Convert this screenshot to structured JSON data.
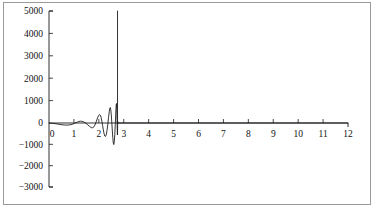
{
  "chart_data": {
    "type": "line",
    "title": "",
    "subtitle": "",
    "xlabel": "",
    "ylabel": "",
    "xlim": [
      0,
      12
    ],
    "ylim": [
      -3000,
      5000
    ],
    "grid": false,
    "legend": null,
    "x_ticks": [
      0,
      1,
      2,
      3,
      4,
      5,
      6,
      7,
      8,
      9,
      10,
      11,
      12
    ],
    "x_tick_labels": [
      "0",
      "1",
      "2",
      "3",
      "4",
      "5",
      "6",
      "7",
      "8",
      "9",
      "10",
      "11",
      "12"
    ],
    "y_ticks": [
      -3000,
      -2000,
      -1000,
      0,
      1000,
      2000,
      3000,
      4000,
      5000
    ],
    "y_tick_labels": [
      "-3000",
      "-2000",
      "-1000",
      "0",
      "1000",
      "2000",
      "3000",
      "4000",
      "5000"
    ],
    "annotations": [
      {
        "name": "vertical-asymptote",
        "x": 2.75,
        "y_from": 0,
        "y_to": 5000
      }
    ],
    "series": [
      {
        "name": "oscillating-divergent-curve",
        "color": "#111111",
        "points": [
          [
            0.0,
            0
          ],
          [
            0.08,
            -8
          ],
          [
            0.16,
            -18
          ],
          [
            0.24,
            -30
          ],
          [
            0.32,
            -45
          ],
          [
            0.4,
            -60
          ],
          [
            0.48,
            -74
          ],
          [
            0.56,
            -88
          ],
          [
            0.64,
            -96
          ],
          [
            0.72,
            -98
          ],
          [
            0.8,
            -92
          ],
          [
            0.88,
            -76
          ],
          [
            0.96,
            -50
          ],
          [
            1.02,
            -20
          ],
          [
            1.08,
            12
          ],
          [
            1.14,
            44
          ],
          [
            1.2,
            68
          ],
          [
            1.26,
            80
          ],
          [
            1.32,
            76
          ],
          [
            1.38,
            56
          ],
          [
            1.44,
            20
          ],
          [
            1.5,
            -30
          ],
          [
            1.56,
            -90
          ],
          [
            1.62,
            -150
          ],
          [
            1.68,
            -200
          ],
          [
            1.72,
            -225
          ],
          [
            1.76,
            -220
          ],
          [
            1.8,
            -180
          ],
          [
            1.84,
            -100
          ],
          [
            1.88,
            10
          ],
          [
            1.92,
            140
          ],
          [
            1.96,
            265
          ],
          [
            2.0,
            350
          ],
          [
            2.03,
            380
          ],
          [
            2.06,
            350
          ],
          [
            2.09,
            250
          ],
          [
            2.12,
            90
          ],
          [
            2.15,
            -110
          ],
          [
            2.18,
            -320
          ],
          [
            2.21,
            -500
          ],
          [
            2.24,
            -610
          ],
          [
            2.27,
            -630
          ],
          [
            2.3,
            -540
          ],
          [
            2.33,
            -340
          ],
          [
            2.36,
            -60
          ],
          [
            2.39,
            250
          ],
          [
            2.42,
            520
          ],
          [
            2.44,
            660
          ],
          [
            2.46,
            690
          ],
          [
            2.48,
            590
          ],
          [
            2.5,
            360
          ],
          [
            2.52,
            40
          ],
          [
            2.54,
            -330
          ],
          [
            2.56,
            -680
          ],
          [
            2.58,
            -930
          ],
          [
            2.6,
            -1010
          ],
          [
            2.62,
            -880
          ],
          [
            2.64,
            -540
          ],
          [
            2.66,
            -60
          ],
          [
            2.68,
            440
          ],
          [
            2.695,
            790
          ],
          [
            2.71,
            870
          ],
          [
            2.72,
            640
          ],
          [
            2.73,
            160
          ],
          [
            2.74,
            -340
          ],
          [
            2.745,
            -560
          ],
          [
            2.75,
            -430
          ],
          [
            2.755,
            -120
          ],
          [
            2.76,
            60
          ],
          [
            2.77,
            30
          ],
          [
            2.78,
            0
          ],
          [
            2.85,
            0
          ],
          [
            3.0,
            0
          ],
          [
            4.0,
            0
          ],
          [
            5.0,
            0
          ],
          [
            6.0,
            0
          ],
          [
            7.0,
            0
          ],
          [
            8.0,
            0
          ],
          [
            9.0,
            0
          ],
          [
            10.0,
            0
          ],
          [
            11.0,
            0
          ],
          [
            12.0,
            0
          ]
        ]
      }
    ]
  },
  "figure": {
    "border_color": "#9a9a9a",
    "background_color": "#ffffff",
    "curve_color": "#111111",
    "axis_color": "#1a1a1a"
  }
}
